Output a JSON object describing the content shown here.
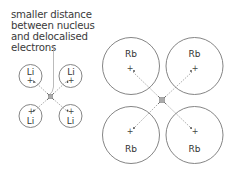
{
  "annotation": {
    "lines": [
      "smaller distance",
      "between nucleus",
      "and delocalised",
      "electrons"
    ]
  },
  "lithium_lattice": {
    "atoms": [
      {
        "label": "Li",
        "nucleus": "+",
        "position": "top-left"
      },
      {
        "label": "Li",
        "nucleus": "+",
        "position": "top-right"
      },
      {
        "label": "Li",
        "nucleus": "+",
        "position": "bottom-left"
      },
      {
        "label": "Li",
        "nucleus": "+",
        "position": "bottom-right"
      }
    ]
  },
  "rubidium_lattice": {
    "atoms": [
      {
        "label": "Rb",
        "nucleus": "+",
        "position": "top-left"
      },
      {
        "label": "Rb",
        "nucleus": "+",
        "position": "top-right"
      },
      {
        "label": "Rb",
        "nucleus": "+",
        "position": "bottom-left"
      },
      {
        "label": "Rb",
        "nucleus": "+",
        "position": "bottom-right"
      }
    ]
  },
  "colors": {
    "outline": "#777777",
    "text": "#333333",
    "dashed": "#999999"
  }
}
